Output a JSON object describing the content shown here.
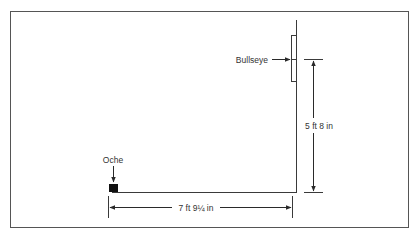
{
  "diagram": {
    "type": "dartboard-throwing-distance",
    "colors": {
      "line": "#3a3a3a",
      "frame": "#555555",
      "background": "#ffffff",
      "text": "#333333"
    },
    "labels": {
      "bullseye": "Bullseye",
      "oche": "Oche",
      "height": "5 ft 8 in",
      "distance": "7 ft 9¼ in"
    },
    "dimensions": {
      "bullseye_height": "5 ft 8 in",
      "throw_distance": "7 ft 9¼ in"
    }
  }
}
